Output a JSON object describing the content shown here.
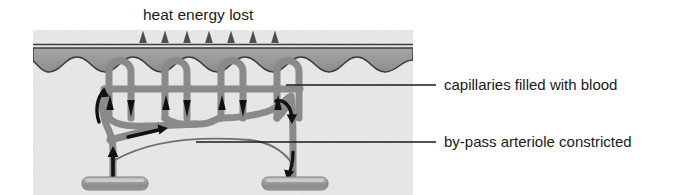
{
  "diagram": {
    "title": "heat energy lost",
    "panel": {
      "x": 33,
      "y": 30,
      "width": 380,
      "height": 165,
      "dermis_color": "#e8e8e6",
      "epidermis_color": "#9a9a9a",
      "surface_line_color": "#3a3a3a"
    },
    "heat_arrows": {
      "name": "heat-loss-arrows",
      "count": 7,
      "color": "#4a4a4a",
      "x_positions": [
        143,
        165,
        187,
        209,
        231,
        253,
        275
      ],
      "base_y": 42,
      "tip_y": 30
    },
    "vessels": {
      "color": "#8a8a8a",
      "outline_color": "#6e6e6e",
      "capillary_loops": 4,
      "flow_arrow_color": "#111111"
    },
    "base_vessels": {
      "name": "arteriole-venule-bases",
      "color": "#8f8f8f",
      "highlight_color": "#c9c9c9",
      "left_label": "arteriole",
      "right_label": "venule"
    },
    "bypass": {
      "label": "by-pass arteriole constricted",
      "color": "#6a6a6a",
      "state": "constricted"
    },
    "callouts": [
      {
        "id": "capillaries",
        "label": "capillaries filled with blood",
        "leader_from_x": 286,
        "leader_to_x": 436,
        "leader_y": 85,
        "text_x": 444,
        "text_y": 90
      },
      {
        "id": "bypass-arteriole",
        "label": "by-pass arteriole constricted",
        "leader_from_x": 196,
        "leader_to_x": 436,
        "leader_y": 142,
        "text_x": 444,
        "text_y": 147
      }
    ],
    "leader_color": "#1a1a1a"
  }
}
